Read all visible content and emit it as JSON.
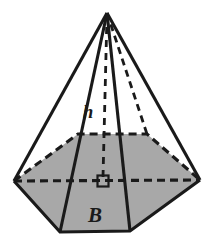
{
  "figure": {
    "name": "hexagonal-pyramid",
    "background_color": "#ffffff",
    "base_fill_color": "#a8a8a8",
    "line_color": "#1a1a1a",
    "labels": {
      "height_label": "h",
      "base_label": "B"
    },
    "geometry": {
      "apex": [
        107,
        13
      ],
      "base_vertices": {
        "left": [
          14,
          181
        ],
        "back_left": [
          78,
          134
        ],
        "back_right": [
          147,
          134
        ],
        "right": [
          200,
          180
        ],
        "front_right": [
          130,
          231
        ],
        "front_left": [
          60,
          232
        ]
      },
      "base_center": [
        103,
        181
      ],
      "right_angle_marker": {
        "x": 97,
        "y": 175,
        "size": 11
      }
    },
    "edges": {
      "solid": [
        "apex-left",
        "apex-front_left",
        "apex-front_right",
        "apex-right",
        "left-front_left",
        "front_left-front_right",
        "front_right-right"
      ],
      "dashed": [
        "apex-back_right",
        "apex-center",
        "left-back_left",
        "back_left-back_right",
        "back_right-right",
        "left-right"
      ]
    }
  }
}
